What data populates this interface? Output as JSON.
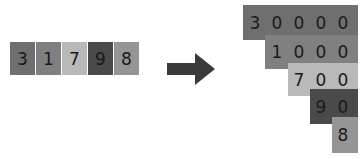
{
  "input": {
    "digits": [
      {
        "value": "3",
        "color": "#6f6f6f"
      },
      {
        "value": "1",
        "color": "#808080"
      },
      {
        "value": "7",
        "color": "#b9b9b9"
      },
      {
        "value": "9",
        "color": "#4a4a4a"
      },
      {
        "value": "8",
        "color": "#959595"
      }
    ]
  },
  "arrow": {
    "icon": "right-arrow-icon",
    "color": "#3a3a3a"
  },
  "output": {
    "rows": [
      {
        "digits": [
          "3",
          "0",
          "0",
          "0",
          "0"
        ],
        "color": "#6f6f6f"
      },
      {
        "digits": [
          "1",
          "0",
          "0",
          "0"
        ],
        "color": "#808080"
      },
      {
        "digits": [
          "7",
          "0",
          "0"
        ],
        "color": "#b9b9b9"
      },
      {
        "digits": [
          "9",
          "0"
        ],
        "color": "#4a4a4a"
      },
      {
        "digits": [
          "8"
        ],
        "color": "#959595"
      }
    ]
  }
}
